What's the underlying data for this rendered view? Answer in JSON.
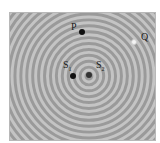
{
  "diagram": {
    "type": "wave-interference",
    "ring_spacing_px": 6,
    "colors": {
      "background": "#9a9a9a",
      "ring_light": "#c4c4c4",
      "ring_dark": "#8a8a8a",
      "dot_dark": "#111111",
      "dot_light": "#f4f4f4",
      "border": "#b8b8b8"
    },
    "points": {
      "P": {
        "label": "P",
        "x": 82,
        "y": 32,
        "fill": "dark"
      },
      "Q": {
        "label": "Q",
        "x": 134,
        "y": 42,
        "fill": "light"
      },
      "S1": {
        "label": "S",
        "sub": "1",
        "x": 73,
        "y": 76,
        "fill": "dark"
      },
      "S2": {
        "label": "S",
        "sub": "2",
        "x": 89,
        "y": 76,
        "fill": "dark"
      }
    }
  }
}
